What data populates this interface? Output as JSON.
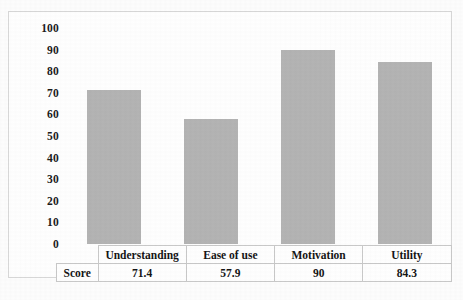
{
  "chart_data": {
    "type": "bar",
    "title": "",
    "subtitle": "",
    "xlabel": "",
    "ylabel": "",
    "categories": [
      "Understanding",
      "Ease of use",
      "Motivation",
      "Utility"
    ],
    "values": [
      71.4,
      57.9,
      90,
      84.3
    ],
    "value_labels": [
      "71.4",
      "57.9",
      "90",
      "84.3"
    ],
    "series": [
      {
        "name": "Score",
        "values": [
          71.4,
          57.9,
          90,
          84.3
        ]
      }
    ],
    "ylim": [
      0,
      100
    ],
    "ytick_step": 10,
    "ytick_labels": [
      "100",
      "90",
      "80",
      "70",
      "60",
      "50",
      "40",
      "30",
      "20",
      "10",
      "0"
    ],
    "ytick_values": [
      100,
      90,
      80,
      70,
      60,
      50,
      40,
      30,
      20,
      10,
      0
    ],
    "grid": false,
    "legend": false,
    "legend_position": "none",
    "bar_color": "#b4b4b4",
    "axis_text_color": "#1b1b1b",
    "frame_color": "#d8d8d8",
    "table_border_color": "#c9c9c9"
  },
  "table": {
    "row_label": "Score",
    "headers": [
      "Understanding",
      "Ease of use",
      "Motivation",
      "Utility"
    ],
    "values": [
      "71.4",
      "57.9",
      "90",
      "84.3"
    ]
  }
}
